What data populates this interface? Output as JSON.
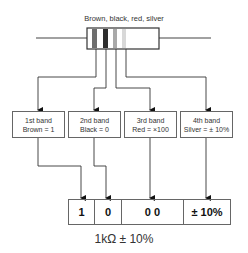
{
  "title": "Brown, black, red, silver",
  "resistor": {
    "bands": [
      {
        "name": "brown",
        "color": "#6e6e6e"
      },
      {
        "name": "black",
        "color": "#2e2e2e"
      },
      {
        "name": "red",
        "color": "#a9a9a9"
      },
      {
        "name": "silver",
        "color": "#d8d8d8"
      }
    ]
  },
  "boxes": [
    {
      "line1": "1st band",
      "line2": "Brown = 1"
    },
    {
      "line1": "2nd band",
      "line2": "Black = 0"
    },
    {
      "line1": "3rd band",
      "line2": "Red = ×100"
    },
    {
      "line1": "4th band",
      "line2": "Silver = ± 10%"
    }
  ],
  "result": {
    "cells": [
      "1",
      "0",
      "0 0",
      "± 10%"
    ]
  },
  "caption": "1kΩ ± 10%"
}
